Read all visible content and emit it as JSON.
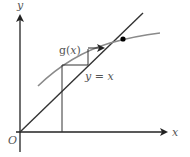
{
  "diagram": {
    "title": "",
    "axes": {
      "x_label": "x",
      "y_label": "y",
      "origin_label": "O"
    },
    "curves": [
      {
        "name": "g(x)",
        "label": "g(x)",
        "color": "#8a8a8a"
      },
      {
        "name": "y = x",
        "label": "y = x",
        "color": "#333333"
      }
    ],
    "labels": {
      "g_prefix": "g(",
      "g_var": "x",
      "g_suffix": ")",
      "line_y": "y",
      "line_eq": " = ",
      "line_x": "x"
    },
    "annotations": {
      "fixed_point": "intersection of g(x) and y = x",
      "cobweb": "staircase iteration converging to fixed point"
    },
    "colors": {
      "axis": "#222222",
      "line": "#333333",
      "curve": "#8a8a8a",
      "point": "#000000",
      "text": "#555555"
    }
  }
}
